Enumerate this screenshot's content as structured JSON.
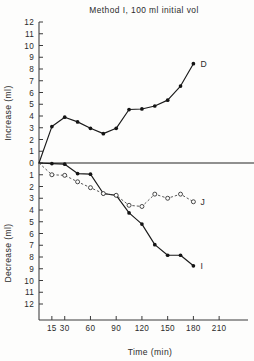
{
  "chart_data": {
    "type": "line",
    "title": "Method I, 100 ml initial vol",
    "xlabel": "Time (min)",
    "ylabel_upper": "Increase (ml)",
    "ylabel_lower": "Decrease (ml)",
    "grid": false,
    "legend_position": "inline-right-of-series",
    "xlim": [
      0,
      225
    ],
    "xticks": [
      15,
      30,
      60,
      90,
      120,
      150,
      180,
      210
    ],
    "xtick_labels": [
      "15",
      "30",
      "60",
      "90",
      "120",
      "150",
      "180",
      "210"
    ],
    "ylim_upper": [
      0,
      12
    ],
    "yticks_upper": [
      0,
      1,
      2,
      3,
      4,
      5,
      6,
      7,
      8,
      9,
      10,
      11,
      12
    ],
    "ytick_labels_upper": [
      "0",
      "1",
      "2",
      "3",
      "4",
      "5",
      "6",
      "7",
      "8",
      "9",
      "10",
      "11",
      "12"
    ],
    "ylim_lower": [
      0,
      12
    ],
    "yticks_lower": [
      0,
      1,
      2,
      3,
      4,
      5,
      6,
      7,
      8,
      9,
      10,
      11,
      12
    ],
    "ytick_labels_lower": [
      "0",
      "1",
      "2",
      "3",
      "4",
      "5",
      "6",
      "7",
      "8",
      "9",
      "10",
      "11",
      "12"
    ],
    "series": [
      {
        "name": "D",
        "label": "D",
        "direction": "increase",
        "marker": "filled-circle",
        "linestyle": "solid",
        "color": "#141414",
        "x": [
          0,
          15,
          30,
          45,
          60,
          75,
          90,
          105,
          120,
          135,
          150,
          165,
          180
        ],
        "values": [
          0.0,
          3.1,
          3.9,
          3.5,
          2.95,
          2.5,
          2.95,
          4.55,
          4.6,
          4.85,
          5.35,
          6.55,
          8.45
        ]
      },
      {
        "name": "I",
        "label": "I",
        "direction": "decrease",
        "marker": "filled-circle",
        "linestyle": "solid",
        "color": "#141414",
        "x": [
          0,
          15,
          30,
          45,
          60,
          75,
          90,
          105,
          120,
          135,
          150,
          165,
          180
        ],
        "values": [
          0.0,
          0.05,
          0.1,
          0.9,
          0.95,
          2.6,
          2.75,
          4.25,
          5.2,
          6.95,
          7.85,
          7.85,
          8.75
        ]
      },
      {
        "name": "J",
        "label": "J",
        "direction": "decrease",
        "marker": "open-circle",
        "linestyle": "dashed",
        "color": "#2a2a2a",
        "x": [
          0,
          15,
          30,
          45,
          60,
          75,
          90,
          105,
          120,
          135,
          150,
          165,
          180
        ],
        "values": [
          0.0,
          1.0,
          1.05,
          1.6,
          2.1,
          2.6,
          2.75,
          3.6,
          3.7,
          2.65,
          3.0,
          2.65,
          3.3
        ]
      }
    ]
  }
}
